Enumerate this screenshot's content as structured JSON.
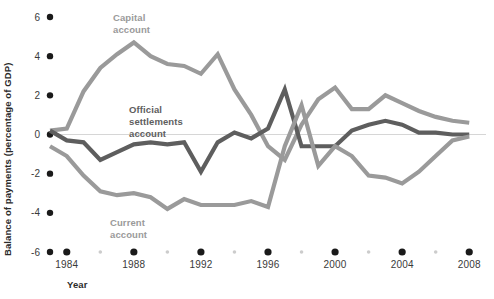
{
  "chart_data": {
    "type": "line",
    "title": "",
    "xlabel": "Year",
    "ylabel": "Balance of payments (percentage of GDP)",
    "xlim": [
      1983,
      2009
    ],
    "ylim": [
      -6,
      6
    ],
    "yticks": [
      6,
      4,
      2,
      0,
      -2,
      -4,
      -6
    ],
    "ytick_labels": [
      "6",
      "4",
      "2",
      "0",
      "-2",
      "-4",
      "-6"
    ],
    "xticks": [
      1984,
      1988,
      1992,
      1996,
      2000,
      2004,
      2008
    ],
    "xtick_labels": [
      "1984",
      "1988",
      "1992",
      "1996",
      "2000",
      "2004",
      "2008"
    ],
    "minor_xticks": [
      1986,
      1990,
      1994,
      1998,
      2002,
      2006
    ],
    "grid": false,
    "zero_line": true,
    "legend_position": "inline-annotations",
    "x": [
      1983,
      1984,
      1985,
      1986,
      1987,
      1988,
      1989,
      1990,
      1991,
      1992,
      1993,
      1994,
      1995,
      1996,
      1997,
      1998,
      1999,
      2000,
      2001,
      2002,
      2003,
      2004,
      2005,
      2006,
      2007,
      2008
    ],
    "series": [
      {
        "name": "Capital account",
        "color": "#9a9a9a",
        "label_position": {
          "x": 1986.6,
          "y": 6.2
        },
        "values": [
          0.2,
          0.3,
          2.2,
          3.4,
          4.1,
          4.7,
          4.0,
          3.6,
          3.5,
          3.1,
          4.1,
          2.3,
          1.0,
          -0.6,
          -1.3,
          0.5,
          1.8,
          2.4,
          1.3,
          1.3,
          2.0,
          1.6,
          1.2,
          0.9,
          0.7,
          0.6
        ]
      },
      {
        "name": "Official settlements account",
        "color": "#5e5e5e",
        "label_position": {
          "x": 1988.2,
          "y": 2.0
        },
        "values": [
          0.2,
          -0.3,
          -0.4,
          -1.3,
          -0.9,
          -0.5,
          -0.4,
          -0.5,
          -0.4,
          -1.9,
          -0.4,
          0.1,
          -0.2,
          0.3,
          2.3,
          -0.6,
          -0.6,
          -0.6,
          0.2,
          0.5,
          0.7,
          0.5,
          0.1,
          0.1,
          0.0,
          0.0
        ]
      },
      {
        "name": "Current account",
        "color": "#9a9a9a",
        "label_position": {
          "x": 1986.8,
          "y": -4.5
        },
        "values": [
          -0.6,
          -1.1,
          -2.1,
          -2.9,
          -3.1,
          -3.0,
          -3.2,
          -3.8,
          -3.3,
          -3.6,
          -3.6,
          -3.6,
          -3.4,
          -3.7,
          -0.6,
          1.5,
          -1.6,
          -0.6,
          -1.1,
          -2.1,
          -2.2,
          -2.5,
          -1.9,
          -1.1,
          -0.3,
          -0.1
        ]
      }
    ]
  },
  "axis": {
    "x_title": "Year",
    "y_title": "Balance of payments (percentage of GDP)"
  },
  "colors": {
    "light_series": "#9a9a9a",
    "dark_series": "#5e5e5e",
    "major_tick_dot": "#1a1a1a",
    "minor_tick_dot": "#cccccc",
    "zero_line": "#d6d6d6",
    "text": "#3a3a3a",
    "background": "#ffffff"
  },
  "series_labels": {
    "capital": {
      "line1": "Capital",
      "line2": "account"
    },
    "official": {
      "line1": "Official",
      "line2": "settlements",
      "line3": "account"
    },
    "current": {
      "line1": "Current",
      "line2": "account"
    }
  }
}
